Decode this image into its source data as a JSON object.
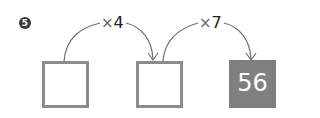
{
  "problem": {
    "number": "5",
    "boxes": [
      {
        "value": "",
        "filled": false
      },
      {
        "value": "",
        "filled": false
      },
      {
        "value": "56",
        "filled": true
      }
    ],
    "operations": [
      {
        "symbol": "×",
        "operand": "4"
      },
      {
        "symbol": "×",
        "operand": "7"
      }
    ]
  },
  "colors": {
    "box_border": "#8c8c8c",
    "filled_box": "#808080",
    "arrow": "#666666"
  }
}
